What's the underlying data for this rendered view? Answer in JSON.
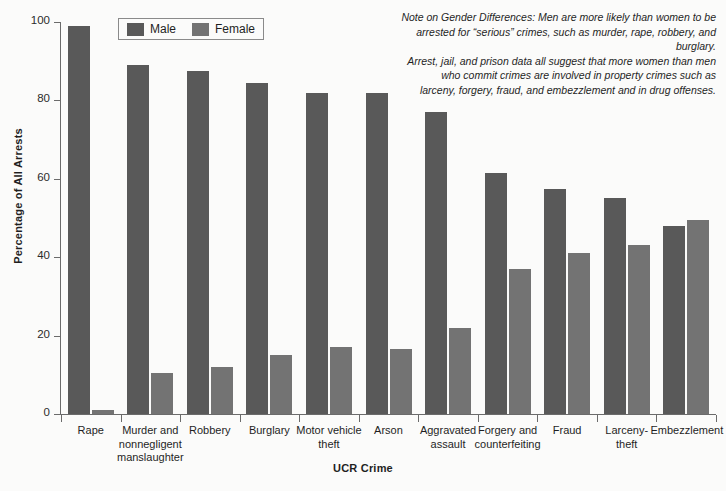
{
  "chart_data": {
    "type": "bar",
    "title": "",
    "xlabel": "UCR Crime",
    "ylabel": "Percentage of All Arrests",
    "ylim": [
      0,
      100
    ],
    "yticks": [
      0,
      20,
      40,
      60,
      80,
      100
    ],
    "grid": false,
    "legend_position": "top-left",
    "categories": [
      "Rape",
      "Murder and nonnegligent manslaughter",
      "Robbery",
      "Burglary",
      "Motor vehicle theft",
      "Arson",
      "Aggravated assault",
      "Forgery and counterfeiting",
      "Fraud",
      "Larceny-theft",
      "Embezzlement"
    ],
    "category_label_lines": [
      [
        "Rape"
      ],
      [
        "Murder and",
        "nonnegligent",
        "manslaughter"
      ],
      [
        "Robbery"
      ],
      [
        "Burglary"
      ],
      [
        "Motor vehicle",
        "theft"
      ],
      [
        "Arson"
      ],
      [
        "Aggravated",
        "assault"
      ],
      [
        "Forgery and",
        "counterfeiting"
      ],
      [
        "Fraud"
      ],
      [
        "Larceny-",
        "theft"
      ],
      [
        "Embezzlement"
      ]
    ],
    "series": [
      {
        "name": "Male",
        "color": "#595959",
        "values": [
          99,
          89,
          87.5,
          84.5,
          82,
          82,
          77,
          61.5,
          57.5,
          55,
          48
        ]
      },
      {
        "name": "Female",
        "color": "#737373",
        "values": [
          1,
          10.5,
          12,
          15,
          17,
          16.5,
          22,
          37,
          41,
          43,
          49.5
        ]
      }
    ]
  },
  "legend": {
    "items": [
      {
        "label": "Male",
        "swatch": "male"
      },
      {
        "label": "Female",
        "swatch": "female"
      }
    ]
  },
  "note": {
    "lines": [
      "Note on Gender Differences: Men are more likely than women to be",
      "arrested for “serious” crimes, such as murder, rape, robbery, and burglary.",
      "Arrest, jail, and prison data all suggest that more women than men",
      "who commit crimes are involved in property crimes such as",
      "larceny, forgery, fraud, and embezzlement and in drug offenses."
    ]
  }
}
